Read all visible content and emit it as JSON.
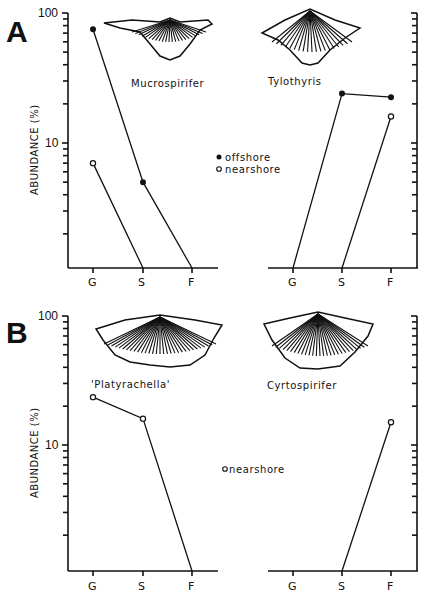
{
  "figure": {
    "y_axis_title": "ABUNDANCE (%)",
    "x_categories": [
      "G",
      "S",
      "F"
    ],
    "y_tick_labels": [
      "100",
      "10"
    ],
    "legend": {
      "offshore": "offshore",
      "nearshore": "nearshore",
      "offshore_marker": "filled-circle",
      "nearshore_marker": "open-circle"
    },
    "panels": [
      {
        "letter": "A",
        "legend_text": [
          "offshore",
          "nearshore"
        ],
        "species": [
          {
            "name": "Mucrospirifer",
            "position": "left"
          },
          {
            "name": "Tylothyris",
            "position": "right"
          }
        ]
      },
      {
        "letter": "B",
        "legend_text": [
          "nearshore"
        ],
        "species": [
          {
            "name": "'Platyrachella'",
            "position": "left"
          },
          {
            "name": "Cyrtospirifer",
            "position": "right"
          }
        ]
      }
    ]
  },
  "chart_data": [
    {
      "type": "line",
      "panel": "A",
      "subplot": "Mucrospirifer",
      "title": "Mucrospirifer",
      "xlabel": "",
      "ylabel": "ABUNDANCE (%)",
      "yscale": "log",
      "ylim": [
        1,
        100
      ],
      "categories": [
        "G",
        "S",
        "F"
      ],
      "series": [
        {
          "name": "offshore",
          "marker": "filled",
          "values": [
            75,
            5,
            0
          ]
        },
        {
          "name": "nearshore",
          "marker": "open",
          "values": [
            7,
            0,
            null
          ]
        }
      ],
      "legend": [
        "offshore",
        "nearshore"
      ],
      "grid": false
    },
    {
      "type": "line",
      "panel": "A",
      "subplot": "Tylothyris",
      "title": "Tylothyris",
      "xlabel": "",
      "ylabel": "ABUNDANCE (%)",
      "yscale": "log",
      "ylim": [
        1,
        100
      ],
      "categories": [
        "G",
        "S",
        "F"
      ],
      "series": [
        {
          "name": "offshore",
          "marker": "filled",
          "values": [
            0,
            24,
            22.5
          ]
        },
        {
          "name": "nearshore",
          "marker": "open",
          "values": [
            null,
            0,
            16
          ]
        }
      ],
      "grid": false
    },
    {
      "type": "line",
      "panel": "B",
      "subplot": "'Platyrachella'",
      "title": "'Platyrachella'",
      "xlabel": "",
      "ylabel": "ABUNDANCE (%)",
      "yscale": "log",
      "ylim": [
        1,
        100
      ],
      "categories": [
        "G",
        "S",
        "F"
      ],
      "series": [
        {
          "name": "nearshore",
          "marker": "open",
          "values": [
            23.5,
            16,
            0
          ]
        }
      ],
      "legend": [
        "nearshore"
      ],
      "grid": false
    },
    {
      "type": "line",
      "panel": "B",
      "subplot": "Cyrtospirifer",
      "title": "Cyrtospirifer",
      "xlabel": "",
      "ylabel": "ABUNDANCE (%)",
      "yscale": "log",
      "ylim": [
        1,
        100
      ],
      "categories": [
        "G",
        "S",
        "F"
      ],
      "series": [
        {
          "name": "nearshore",
          "marker": "open",
          "values": [
            null,
            0,
            15
          ]
        }
      ],
      "grid": false
    }
  ]
}
